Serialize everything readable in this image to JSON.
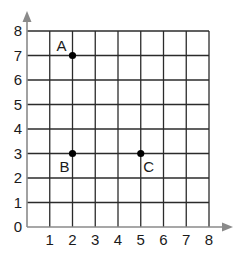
{
  "chart_data": {
    "type": "scatter",
    "title": "",
    "xlabel": "",
    "ylabel": "",
    "xlim": [
      0,
      8
    ],
    "ylim": [
      0,
      8
    ],
    "grid": true,
    "x_ticks": [
      "0",
      "1",
      "2",
      "3",
      "4",
      "5",
      "6",
      "7",
      "8"
    ],
    "y_ticks": [
      "0",
      "1",
      "2",
      "3",
      "4",
      "5",
      "6",
      "7",
      "8"
    ],
    "points": [
      {
        "label": "A",
        "x": 2,
        "y": 7
      },
      {
        "label": "B",
        "x": 2,
        "y": 3
      },
      {
        "label": "C",
        "x": 5,
        "y": 3
      }
    ],
    "colors": {
      "grid": "#2b2b2b",
      "axis": "#8a8a8a",
      "point": "#000000"
    }
  }
}
